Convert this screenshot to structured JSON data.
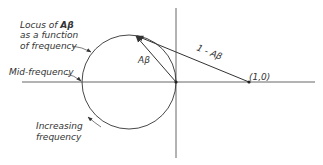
{
  "figure": {
    "type": "Nyquist-style polar plot of loop gain",
    "colors": {
      "ink": "#333333",
      "background": "#ffffff"
    }
  },
  "labels": {
    "locus_line1": "Locus of ",
    "locus_line1_sym": "Aβ",
    "locus_line2": "as a function",
    "locus_line3": "of frequency",
    "mid_frequency": "Mid-frequency",
    "increasing_line1": "Increasing",
    "increasing_line2": "frequency",
    "vector_ab": "Aβ",
    "vector_one_minus_ab": "1 - Aβ",
    "point_one_zero": "(1,0)"
  },
  "geometry": {
    "origin": [
      176,
      82
    ],
    "circle_center": [
      129,
      82
    ],
    "circle_radius": 47,
    "point_one_zero": [
      249,
      82
    ],
    "locus_point": [
      135,
      35
    ]
  }
}
